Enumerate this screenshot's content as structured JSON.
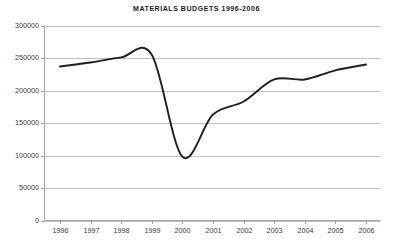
{
  "chart_data": {
    "type": "line",
    "title": "MATERIALS BUDGETS 1996-2006",
    "xlabel": "",
    "ylabel": "",
    "categories": [
      "1996",
      "1997",
      "1998",
      "1999",
      "2000",
      "2001",
      "2002",
      "2003",
      "2004",
      "2005",
      "2006"
    ],
    "x": [
      1996,
      1997,
      1998,
      1999,
      2000,
      2001,
      2002,
      2003,
      2004,
      2005,
      2006
    ],
    "values": [
      237000,
      243000,
      251000,
      255000,
      98000,
      163000,
      183000,
      217000,
      217000,
      231000,
      240000
    ],
    "series": [
      {
        "name": "Materials Budget",
        "values": [
          237000,
          243000,
          251000,
          255000,
          98000,
          163000,
          183000,
          217000,
          217000,
          231000,
          240000
        ]
      }
    ],
    "ylim": [
      0,
      300000
    ],
    "ytick_values": [
      0,
      50000,
      100000,
      150000,
      200000,
      250000,
      300000
    ],
    "ytick_labels": [
      "0",
      "50000",
      "100000",
      "150000",
      "200000",
      "250000",
      "300000"
    ],
    "xlim": [
      1996,
      2006
    ],
    "grid": "horizontal",
    "legend": "none",
    "line_color": "#1f1f1f",
    "grid_color": "#b9b9b9",
    "axis_color": "#9a9a9a",
    "smoothing": "spline"
  }
}
